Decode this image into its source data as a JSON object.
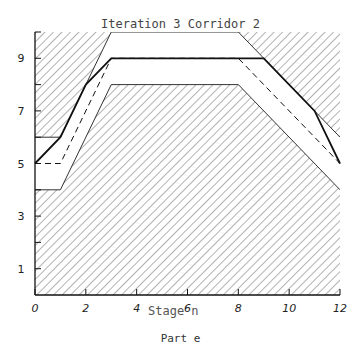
{
  "chart_data": {
    "type": "line",
    "title": "Iteration 3 Corridor 2",
    "xlabel": "Stage n",
    "ylabel": "",
    "caption": "Part e",
    "xlim": [
      0,
      12
    ],
    "ylim": [
      0,
      10
    ],
    "x_ticks": [
      0,
      2,
      4,
      6,
      8,
      10,
      12
    ],
    "y_ticks": [
      1,
      3,
      5,
      7,
      9
    ],
    "grid": false,
    "legend": null,
    "corridor": {
      "upper_bound": {
        "x": [
          0,
          1,
          3,
          8,
          12
        ],
        "y": [
          6,
          6,
          10,
          10,
          6
        ]
      },
      "lower_bound": {
        "x": [
          0,
          1,
          3,
          8,
          12
        ],
        "y": [
          4,
          4,
          8,
          8,
          4
        ]
      },
      "fill": "hatched (infeasible region outside corridor)"
    },
    "series": [
      {
        "name": "optimal trajectory (solid)",
        "style": "solid",
        "x": [
          0,
          1,
          2,
          3,
          9,
          11,
          12
        ],
        "y": [
          5,
          6,
          8,
          9,
          9,
          7,
          5
        ]
      },
      {
        "name": "trial trajectory (dashed)",
        "style": "dashed",
        "x": [
          0,
          1,
          3,
          8,
          12
        ],
        "y": [
          5,
          5,
          9,
          9,
          5
        ]
      }
    ]
  }
}
